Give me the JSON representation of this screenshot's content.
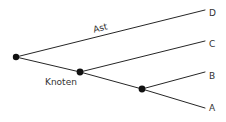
{
  "diagram": {
    "background_color": "#ffffff",
    "line_color": "#262626",
    "node_color": "#111111",
    "text_color": "#333333",
    "nodes": [
      {
        "id": "root",
        "name": "root-node",
        "x": 16,
        "y": 57,
        "r": 3.2
      },
      {
        "id": "knoten",
        "name": "knoten-node",
        "x": 80,
        "y": 72,
        "r": 3.4
      },
      {
        "id": "fork",
        "name": "fork-node",
        "x": 142,
        "y": 89,
        "r": 3.4
      }
    ],
    "edges": [
      {
        "name": "edge-root-to-D",
        "x1": 16,
        "y1": 57,
        "x2": 205,
        "y2": 10
      },
      {
        "name": "edge-root-to-knoten",
        "x1": 16,
        "y1": 57,
        "x2": 80,
        "y2": 72
      },
      {
        "name": "edge-knoten-to-C",
        "x1": 80,
        "y1": 72,
        "x2": 205,
        "y2": 41
      },
      {
        "name": "edge-knoten-to-fork",
        "x1": 80,
        "y1": 72,
        "x2": 142,
        "y2": 89
      },
      {
        "name": "edge-fork-to-B",
        "x1": 142,
        "y1": 89,
        "x2": 205,
        "y2": 72
      },
      {
        "name": "edge-fork-to-A",
        "x1": 142,
        "y1": 89,
        "x2": 205,
        "y2": 108
      }
    ],
    "endpoint_labels": [
      {
        "id": "D",
        "name": "endpoint-label-D",
        "text": "D",
        "x": 209,
        "y": 16
      },
      {
        "id": "C",
        "name": "endpoint-label-C",
        "text": "C",
        "x": 209,
        "y": 47
      },
      {
        "id": "B",
        "name": "endpoint-label-B",
        "text": "B",
        "x": 209,
        "y": 79
      },
      {
        "id": "A",
        "name": "endpoint-label-A",
        "text": "A",
        "x": 209,
        "y": 111
      }
    ],
    "annotations": [
      {
        "id": "ast",
        "name": "branch-label-ast",
        "text": "Ast",
        "x": 101,
        "y": 31,
        "rotation": -14
      },
      {
        "id": "knoten",
        "name": "node-label-knoten",
        "text": "Knoten",
        "x": 45,
        "y": 85,
        "rotation": 0
      }
    ]
  }
}
